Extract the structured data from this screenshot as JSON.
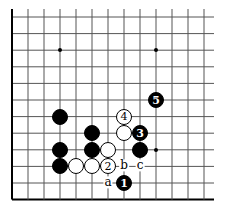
{
  "board": {
    "origin_x": 12,
    "origin_y": 17,
    "spacing_x": 16,
    "spacing_y": 16.6,
    "cols": 13,
    "rows": 12,
    "line_color": "#555555",
    "edge_color": "#000000",
    "edges": [
      "left",
      "bottom"
    ]
  },
  "hoshi": [
    {
      "col": 3,
      "row": 2
    },
    {
      "col": 9,
      "row": 2
    },
    {
      "col": 9,
      "row": 8
    }
  ],
  "stones": [
    {
      "color": "black",
      "col": 3,
      "row": 6,
      "label": ""
    },
    {
      "color": "white",
      "col": 7,
      "row": 6,
      "label": "4"
    },
    {
      "color": "black",
      "col": 9,
      "row": 5,
      "label": "5"
    },
    {
      "color": "black",
      "col": 5,
      "row": 7,
      "label": ""
    },
    {
      "color": "white",
      "col": 7,
      "row": 7,
      "label": ""
    },
    {
      "color": "black",
      "col": 8,
      "row": 7,
      "label": "3"
    },
    {
      "color": "black",
      "col": 3,
      "row": 8,
      "label": ""
    },
    {
      "color": "black",
      "col": 5,
      "row": 8,
      "label": ""
    },
    {
      "color": "white",
      "col": 6,
      "row": 8,
      "label": ""
    },
    {
      "color": "black",
      "col": 8,
      "row": 8,
      "label": ""
    },
    {
      "color": "black",
      "col": 3,
      "row": 9,
      "label": ""
    },
    {
      "color": "white",
      "col": 4,
      "row": 9,
      "label": ""
    },
    {
      "color": "white",
      "col": 5,
      "row": 9,
      "label": ""
    },
    {
      "color": "white",
      "col": 6,
      "row": 9,
      "label": "2"
    },
    {
      "color": "black",
      "col": 7,
      "row": 10,
      "label": "1"
    }
  ],
  "labels": [
    {
      "text": "b",
      "col": 7,
      "row": 9
    },
    {
      "text": "c",
      "col": 8,
      "row": 9
    },
    {
      "text": "a",
      "col": 6,
      "row": 10
    }
  ]
}
